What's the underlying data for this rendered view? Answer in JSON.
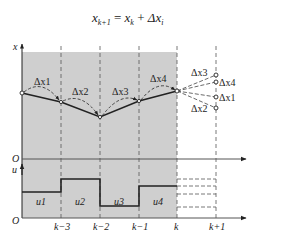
{
  "formula": {
    "lhs": "x",
    "lhs_sub": "k+1",
    "eq": " = ",
    "rhs1": "x",
    "rhs1_sub": "k",
    "plus": " + ",
    "rhs2": "Δx",
    "rhs2_sub": "i"
  },
  "axes": {
    "x_label": "x",
    "u_label": "u",
    "origin_top": "O",
    "origin_bottom": "O"
  },
  "ticks": [
    "k−3",
    "k−2",
    "k−1",
    "k",
    "k+1"
  ],
  "increments": {
    "left": [
      "Δx1",
      "Δx2",
      "Δx3",
      "Δx4"
    ],
    "right": [
      "Δx3",
      "Δx4",
      "Δx1",
      "Δx2"
    ]
  },
  "controls": [
    "u1",
    "u2",
    "u3",
    "u4"
  ],
  "colors": {
    "shade": "#cfcfcf",
    "line": "#222222",
    "dash": "#555555"
  }
}
